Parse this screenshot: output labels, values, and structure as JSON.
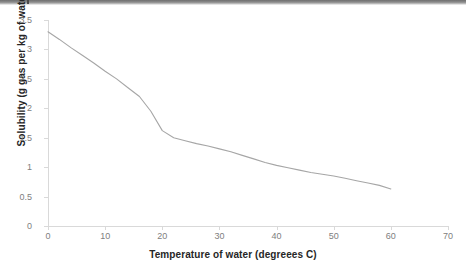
{
  "chart_data": {
    "type": "line",
    "title": "",
    "xlabel": "Temperature of  water (degreees C)",
    "ylabel": "Solubility (g gas per kg of water)",
    "xlim": [
      0,
      70
    ],
    "ylim": [
      0,
      3.5
    ],
    "x_ticks": [
      0,
      10,
      20,
      30,
      40,
      50,
      60,
      70
    ],
    "x_tick_labels": [
      "0",
      "10",
      "20",
      "30",
      "40",
      "50",
      "60",
      "70"
    ],
    "y_ticks": [
      0,
      0.5,
      1,
      1.5,
      2,
      2.5,
      3,
      3.5
    ],
    "y_tick_labels": [
      "0",
      "0.5",
      "1",
      "1.5",
      "2",
      "2.5",
      "3",
      "3.5"
    ],
    "grid": false,
    "legend": "none",
    "series": [
      {
        "name": "Solubility",
        "color": "#a6a6a6",
        "x": [
          0,
          2,
          4,
          6,
          8,
          10,
          12,
          14,
          16,
          18,
          20,
          22,
          24,
          26,
          28,
          30,
          32,
          34,
          36,
          38,
          40,
          42,
          44,
          46,
          48,
          50,
          52,
          54,
          56,
          58,
          60
        ],
        "y": [
          3.3,
          3.17,
          3.03,
          2.9,
          2.77,
          2.63,
          2.5,
          2.35,
          2.2,
          1.95,
          1.62,
          1.5,
          1.45,
          1.4,
          1.36,
          1.31,
          1.26,
          1.2,
          1.14,
          1.08,
          1.03,
          0.99,
          0.95,
          0.91,
          0.88,
          0.85,
          0.81,
          0.77,
          0.73,
          0.69,
          0.63
        ]
      }
    ]
  },
  "colors": {
    "line": "#a6a6a6",
    "axis": "#d9d9d9",
    "tick_label": "#808080",
    "axis_title": "#262626",
    "background": "#ffffff",
    "top_band": "#6f6f6f"
  }
}
